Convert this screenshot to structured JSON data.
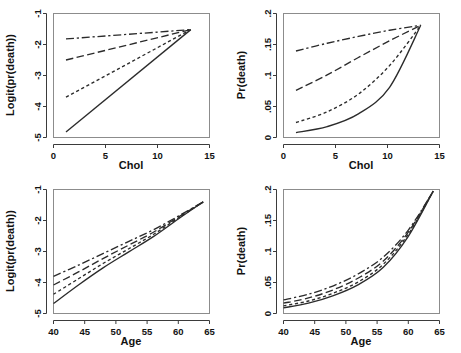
{
  "figure": {
    "title": "",
    "layout": "2x2 grid of regression prediction plots",
    "line_styles": [
      "solid",
      "short-dash",
      "long-dash",
      "dash-dot"
    ],
    "line_color": "#2b2b2b",
    "box_color": "#8c8c8c"
  },
  "chart_data": [
    {
      "type": "line",
      "panel": "top-left",
      "title": "",
      "xlabel": "Chol",
      "ylabel": "Logit(pr(death))",
      "xlim": [
        0,
        15
      ],
      "ylim": [
        -5,
        -1
      ],
      "xticks": [
        0,
        5,
        10,
        15
      ],
      "xticklabels": [
        "0",
        "5",
        "10",
        "15"
      ],
      "yticks": [
        -5,
        -4,
        -3,
        -2,
        -1
      ],
      "yticklabels": [
        "-5",
        "-4",
        "-3",
        "-2",
        "-1"
      ],
      "grid": false,
      "legend": "none",
      "x": [
        1.2,
        13.2
      ],
      "series": [
        {
          "name": "group-1",
          "style": "solid",
          "values": [
            -4.82,
            -1.52
          ]
        },
        {
          "name": "group-2",
          "style": "short-dash",
          "values": [
            -3.7,
            -1.52
          ]
        },
        {
          "name": "group-3",
          "style": "long-dash",
          "values": [
            -2.5,
            -1.52
          ]
        },
        {
          "name": "group-4",
          "style": "dash-dot",
          "values": [
            -1.82,
            -1.52
          ]
        }
      ]
    },
    {
      "type": "line",
      "panel": "top-right",
      "title": "",
      "xlabel": "Chol",
      "ylabel": "Pr(death)",
      "xlim": [
        0,
        15
      ],
      "ylim": [
        0,
        0.2
      ],
      "xticks": [
        0,
        5,
        10,
        15
      ],
      "xticklabels": [
        "0",
        "5",
        "10",
        "15"
      ],
      "yticks": [
        0,
        0.05,
        0.1,
        0.15,
        0.2
      ],
      "yticklabels": [
        "0",
        ".05",
        ".1",
        ".15",
        ".2"
      ],
      "grid": false,
      "legend": "none",
      "x": [
        1.2,
        4.2,
        7.2,
        10.2,
        13.2
      ],
      "series": [
        {
          "name": "group-1",
          "style": "solid",
          "values": [
            0.008,
            0.0175,
            0.038,
            0.081,
            0.181
          ]
        },
        {
          "name": "group-2",
          "style": "short-dash",
          "values": [
            0.0242,
            0.0415,
            0.07,
            0.116,
            0.181
          ]
        },
        {
          "name": "group-3",
          "style": "long-dash",
          "values": [
            0.076,
            0.101,
            0.129,
            0.156,
            0.181
          ]
        },
        {
          "name": "group-4",
          "style": "dash-dot",
          "values": [
            0.1395,
            0.152,
            0.163,
            0.173,
            0.181
          ]
        }
      ]
    },
    {
      "type": "line",
      "panel": "bottom-left",
      "title": "",
      "xlabel": "Age",
      "ylabel": "Logit(pr(death))",
      "xlim": [
        40,
        65
      ],
      "ylim": [
        -5,
        -1
      ],
      "xticks": [
        40,
        45,
        50,
        55,
        60,
        65
      ],
      "xticklabels": [
        "40",
        "45",
        "50",
        "55",
        "60",
        "65"
      ],
      "yticks": [
        -5,
        -4,
        -3,
        -2,
        -1
      ],
      "yticklabels": [
        "-5",
        "-4",
        "-3",
        "-2",
        "-1"
      ],
      "grid": false,
      "legend": "none",
      "x": [
        40,
        44,
        48,
        52,
        56,
        60,
        64
      ],
      "series": [
        {
          "name": "group-1",
          "style": "solid",
          "values": [
            -4.68,
            -4.08,
            -3.52,
            -3.02,
            -2.52,
            -1.95,
            -1.4
          ]
        },
        {
          "name": "group-2",
          "style": "short-dash",
          "values": [
            -4.38,
            -3.88,
            -3.38,
            -2.92,
            -2.45,
            -1.92,
            -1.4
          ]
        },
        {
          "name": "group-3",
          "style": "long-dash",
          "values": [
            -4.08,
            -3.66,
            -3.22,
            -2.8,
            -2.38,
            -1.89,
            -1.4
          ]
        },
        {
          "name": "group-4",
          "style": "dash-dot",
          "values": [
            -3.8,
            -3.44,
            -3.06,
            -2.68,
            -2.3,
            -1.86,
            -1.4
          ]
        }
      ]
    },
    {
      "type": "line",
      "panel": "bottom-right",
      "title": "",
      "xlabel": "Age",
      "ylabel": "Pr(death)",
      "xlim": [
        40,
        65
      ],
      "ylim": [
        0,
        0.2
      ],
      "xticks": [
        40,
        45,
        50,
        55,
        60,
        65
      ],
      "xticklabels": [
        "40",
        "45",
        "50",
        "55",
        "60",
        "65"
      ],
      "yticks": [
        0,
        0.05,
        0.1,
        0.15,
        0.2
      ],
      "yticklabels": [
        "0",
        ".05",
        ".1",
        ".15",
        ".2"
      ],
      "grid": false,
      "legend": "none",
      "x": [
        40,
        44,
        48,
        52,
        56,
        60,
        64
      ],
      "series": [
        {
          "name": "group-1",
          "style": "solid",
          "values": [
            0.0092,
            0.0166,
            0.0288,
            0.0466,
            0.0745,
            0.1245,
            0.1975
          ]
        },
        {
          "name": "group-2",
          "style": "short-dash",
          "values": [
            0.0124,
            0.0202,
            0.0329,
            0.0511,
            0.0795,
            0.128,
            0.1975
          ]
        },
        {
          "name": "group-3",
          "style": "long-dash",
          "values": [
            0.0166,
            0.0251,
            0.0383,
            0.0573,
            0.0847,
            0.1312,
            0.1975
          ]
        },
        {
          "name": "group-4",
          "style": "dash-dot",
          "values": [
            0.0219,
            0.0311,
            0.0447,
            0.0641,
            0.0911,
            0.1345,
            0.1975
          ]
        }
      ]
    }
  ]
}
